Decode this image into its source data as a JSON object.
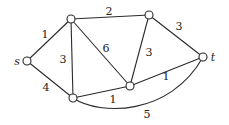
{
  "diagram": {
    "type": "weighted-undirected-graph",
    "nodes": [
      {
        "id": "s",
        "label": "s",
        "x": 27,
        "y": 61,
        "label_x": 17,
        "label_y": 61
      },
      {
        "id": "a",
        "label": "",
        "x": 71,
        "y": 19
      },
      {
        "id": "b",
        "label": "",
        "x": 73,
        "y": 98
      },
      {
        "id": "c",
        "label": "",
        "x": 149,
        "y": 15
      },
      {
        "id": "d",
        "label": "",
        "x": 130,
        "y": 86
      },
      {
        "id": "t",
        "label": "t",
        "x": 203,
        "y": 57,
        "label_x": 213,
        "label_y": 57
      }
    ],
    "edges": [
      {
        "from": "s",
        "to": "a",
        "weight": "1",
        "label_x": 45,
        "label_y": 34
      },
      {
        "from": "s",
        "to": "b",
        "weight": "4",
        "label_x": 46,
        "label_y": 87
      },
      {
        "from": "a",
        "to": "b",
        "weight": "3",
        "label_x": 63,
        "label_y": 59
      },
      {
        "from": "a",
        "to": "c",
        "weight": "2",
        "label_x": 109,
        "label_y": 11
      },
      {
        "from": "a",
        "to": "d",
        "weight": "6",
        "label_x": 106,
        "label_y": 48
      },
      {
        "from": "c",
        "to": "d",
        "weight": "3",
        "label_x": 149,
        "label_y": 52
      },
      {
        "from": "c",
        "to": "t",
        "weight": "3",
        "label_x": 179,
        "label_y": 26
      },
      {
        "from": "b",
        "to": "d",
        "weight": "1",
        "label_x": 113,
        "label_y": 99
      },
      {
        "from": "d",
        "to": "t",
        "weight": "1",
        "label_x": 166,
        "label_y": 76
      },
      {
        "from": "b",
        "to": "t",
        "weight": "5",
        "label_x": 147,
        "label_y": 114,
        "curved": true
      }
    ]
  }
}
